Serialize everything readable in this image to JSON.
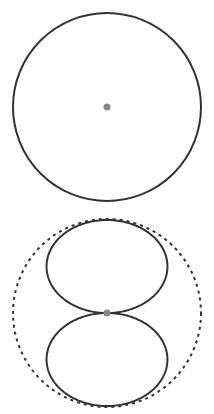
{
  "diagram": {
    "patterns": [
      {
        "id": "omnidirectional",
        "label": "Omnidirectional",
        "shape": "circle"
      },
      {
        "id": "bidirectional",
        "label": "Bidirectional (figure-8)",
        "shape": "figure-eight",
        "reference": "dashed circle"
      }
    ],
    "colors": {
      "outline": "#333333",
      "center_dot": "#888888",
      "reference": "#333333",
      "background": "#ffffff"
    }
  }
}
